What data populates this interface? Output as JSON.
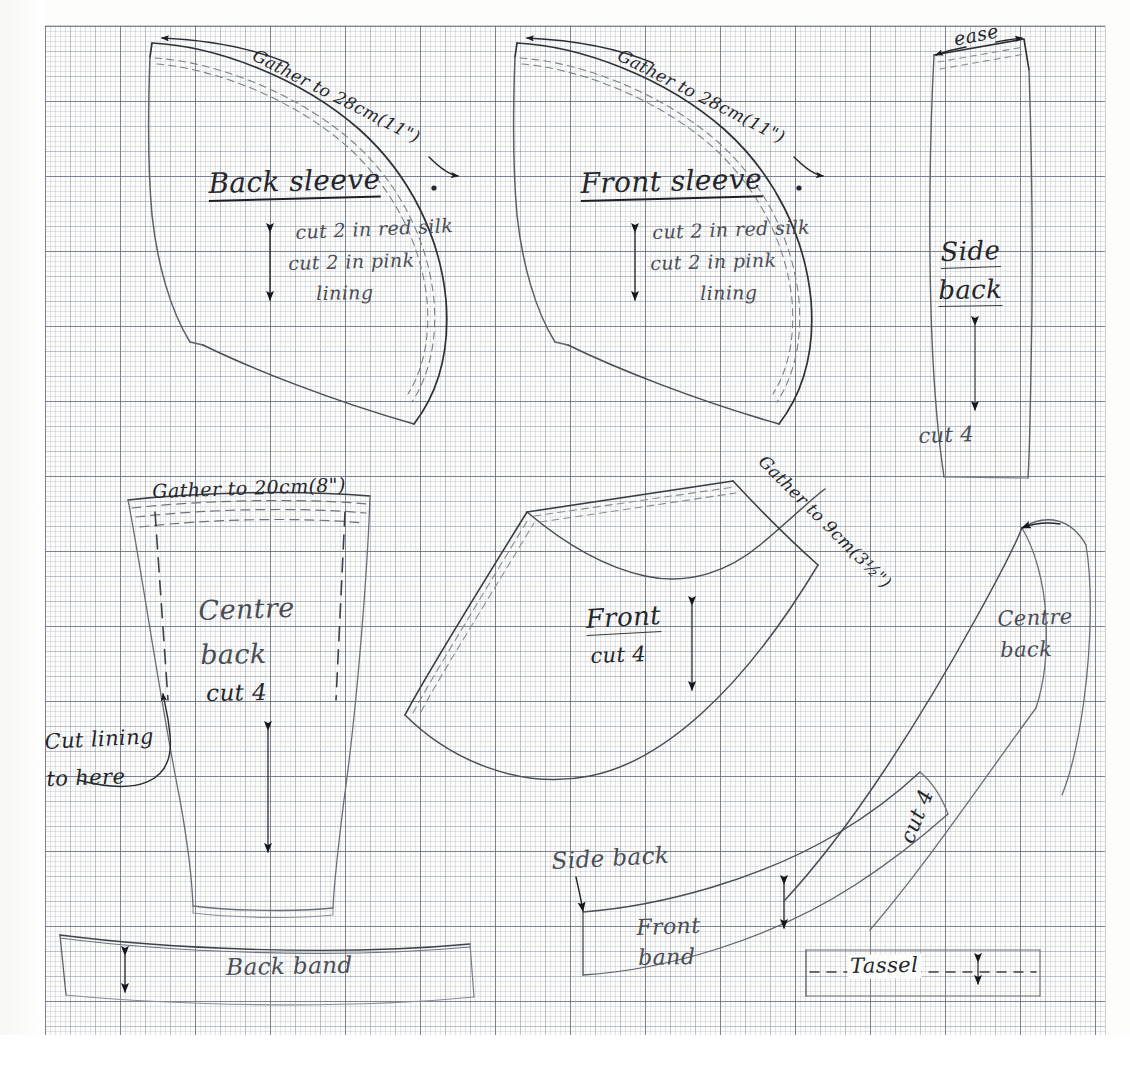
{
  "sheet": {
    "title": "Hand-drawn sewing pattern on graph paper",
    "ink_color": "#24262c",
    "paper_color": "#fcfcfa",
    "grid_color": "#5a5f6e"
  },
  "pieces": {
    "back_sleeve": {
      "name": "Back sleeve",
      "gather_note": "Gather to 28cm(11\")",
      "cut_note_1": "cut 2 in red silk",
      "cut_note_2": "cut 2 in pink",
      "cut_note_3": "lining"
    },
    "front_sleeve": {
      "name": "Front sleeve",
      "gather_note": "Gather to 28cm(11\")",
      "cut_note_1": "cut 2 in red silk",
      "cut_note_2": "cut 2 in pink",
      "cut_note_3": "lining"
    },
    "side_back": {
      "name_line_1": "Side",
      "name_line_2": "back",
      "ease_note": "ease",
      "cut_note": "cut 4"
    },
    "centre_back": {
      "name_line_1": "Centre",
      "name_line_2": "back",
      "gather_note": "Gather to 20cm(8\")",
      "cut_note": "cut 4",
      "lining_note_1": "Cut lining",
      "lining_note_2": "to here"
    },
    "front": {
      "name": "Front",
      "cut_note": "cut 4",
      "gather_note": "Gather to 9cm(3½\")"
    },
    "centre_back_right": {
      "name_line_1": "Centre",
      "name_line_2": "back"
    },
    "back_band": {
      "name": "Back band"
    },
    "front_band": {
      "label_line_1": "Front",
      "label_line_2": "band",
      "side_back_label": "Side back",
      "cut_note": "cut 4"
    },
    "tassel": {
      "name": "Tassel"
    }
  }
}
